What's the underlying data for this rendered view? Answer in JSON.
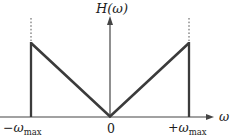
{
  "figure": {
    "y_axis_label": "H(ω)",
    "x_axis_label": "ω",
    "origin_label": "0",
    "cutoff_labels": {
      "left": {
        "symbol": "−ω",
        "subscript": "max"
      },
      "right": {
        "symbol": "+ω",
        "subscript": "max"
      }
    },
    "curve": {
      "type": "triangular-magnitude-response",
      "value_at_origin": "0",
      "peaks_at": [
        "−ωmax",
        "+ωmax"
      ],
      "cutoff_beyond_peaks": true
    },
    "colors": {
      "curve_line": "#3b3b3b",
      "axis_line": "#454545",
      "text": "#1c1c1c",
      "background": "#ffffff"
    }
  }
}
